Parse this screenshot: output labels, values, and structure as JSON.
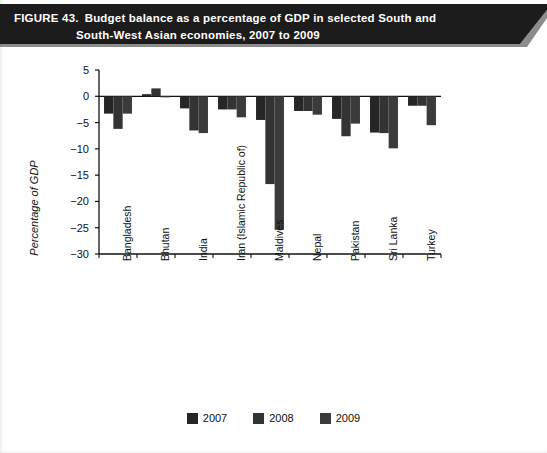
{
  "figure": {
    "number_label": "FIGURE 43.",
    "caption_line1": "Budget balance as a percentage of GDP in selected South and",
    "caption_line2": "South-West Asian economies, 2007 to 2009",
    "banner_color": "#1c1c1c",
    "banner_text_color": "#ffffff"
  },
  "chart_data": {
    "type": "bar",
    "title": "Budget balance as a percentage of GDP in selected South and South-West Asian economies, 2007 to 2009",
    "xlabel": "",
    "ylabel": "Percentage of GDP",
    "ylim": [
      -30,
      5
    ],
    "yticks": [
      5,
      0,
      -5,
      -10,
      -15,
      -20,
      -25,
      -30
    ],
    "ytick_labels": [
      "5",
      "0",
      "−5",
      "−10",
      "−15",
      "−20",
      "−25",
      "−30"
    ],
    "grid": false,
    "legend_position": "bottom-center",
    "categories": [
      "Bangladesh",
      "Bhutan",
      "India",
      "Iran (Islamic Republic of)",
      "Maldives",
      "Nepal",
      "Pakistan",
      "Sri Lanka",
      "Turkey"
    ],
    "series": [
      {
        "name": "2007",
        "color": "#262626",
        "values": [
          -3.3,
          0.4,
          -2.3,
          -2.5,
          -4.5,
          -2.8,
          -4.3,
          -6.9,
          -1.8
        ]
      },
      {
        "name": "2008",
        "color": "#333333",
        "values": [
          -6.2,
          1.5,
          -6.5,
          -2.5,
          -16.7,
          -2.8,
          -7.6,
          -7.0,
          -1.8
        ]
      },
      {
        "name": "2009",
        "color": "#3b3b3b",
        "values": [
          -3.3,
          -0.2,
          -7.0,
          -4.0,
          -25.4,
          -3.5,
          -5.2,
          -9.9,
          -5.5
        ]
      }
    ]
  },
  "legend": {
    "items": [
      {
        "label": "2007",
        "color": "#262626"
      },
      {
        "label": "2008",
        "color": "#333333"
      },
      {
        "label": "2009",
        "color": "#3b3b3b"
      }
    ]
  },
  "axes": {
    "y_title": "Percentage of GDP",
    "axis_color": "#111111"
  }
}
